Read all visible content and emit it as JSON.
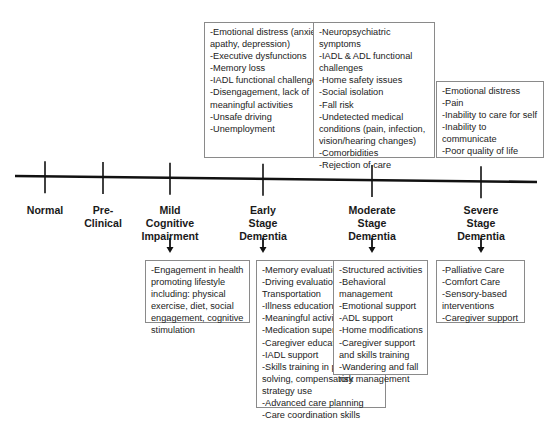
{
  "timeline": {
    "stages": [
      {
        "id": "normal",
        "lines": [
          "Normal"
        ],
        "x": 45
      },
      {
        "id": "pre-clinical",
        "lines": [
          "Pre-",
          "Clinical"
        ],
        "x": 103
      },
      {
        "id": "mci",
        "lines": [
          "Mild",
          "Cognitive",
          "Impairment"
        ],
        "x": 170
      },
      {
        "id": "early",
        "lines": [
          "Early",
          "Stage",
          "Dementia"
        ],
        "x": 263
      },
      {
        "id": "moderate",
        "lines": [
          "Moderate",
          "Stage",
          "Dementia"
        ],
        "x": 372
      },
      {
        "id": "severe",
        "lines": [
          "Severe",
          "Stage",
          "Dementia"
        ],
        "x": 481
      }
    ]
  },
  "challenges": {
    "early": [
      "-Emotional distress (anxiety, apathy, depression)",
      "-Executive dysfunctions",
      "-Memory loss",
      "-IADL functional challenges",
      "-Disengagement, lack of meaningful activities",
      "-Unsafe driving",
      "-Unemployment"
    ],
    "moderate": [
      "-Neuropsychiatric symptoms",
      "-IADL & ADL functional challenges",
      "-Home safety issues",
      "-Social isolation",
      "-Fall risk",
      "-Undetected medical conditions (pain, infection, vision/hearing changes)",
      "-Comorbidities",
      "-Rejection of care"
    ],
    "severe": [
      "-Emotional distress",
      "-Pain",
      "-Inability to care for self",
      "-Inability to communicate",
      "-Poor quality of life"
    ]
  },
  "interventions": {
    "mci": [
      "-Engagement in health promoting lifestyle including: physical exercise, diet, social engagement, cognitive stimulation"
    ],
    "early": [
      "-Memory evaluation",
      "-Driving evaluation/ Transportation",
      "-Illness education",
      "-Meaningful activities",
      "-Medication supervision",
      "-Caregiver education",
      "-IADL support",
      "-Skills training in problem solving, compensatory strategy use",
      "-Advanced care planning",
      "-Care coordination skills"
    ],
    "moderate": [
      "-Structured activities",
      "-Behavioral management",
      "-Emotional support",
      "-ADL support",
      "-Home modifications",
      "-Caregiver support and skills training",
      "-Wandering and fall risk management"
    ],
    "severe": [
      "-Palliative Care",
      "-Comfort Care",
      "-Sensory-based interventions",
      "-Caregiver support"
    ]
  },
  "colors": {
    "line": "#111111",
    "box_border": "#8a8a8a",
    "text": "#222222"
  }
}
